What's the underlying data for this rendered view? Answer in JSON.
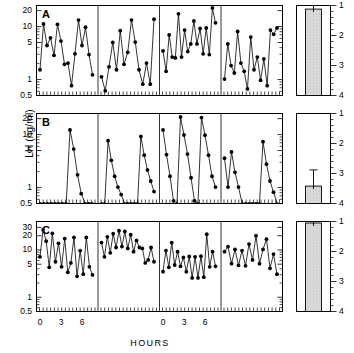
{
  "figure": {
    "axis_label_left": "LH (ng/ml)",
    "axis_label_right": "LH INTERPULSE INTERVAL  (hours)",
    "axis_label_x": "HOURS"
  },
  "chart_data": {
    "type": "line",
    "title": "",
    "xlabel": "HOURS",
    "ylabel": "LH (ng/ml)",
    "y_scale": "log",
    "x_scale": "linear",
    "xlim": [
      0,
      7.5
    ],
    "x_tick_labels": [
      "0",
      "3",
      "6"
    ],
    "x_tick_values": [
      0,
      3,
      6
    ],
    "grid": false,
    "legend": false,
    "panels": [
      {
        "id": "A",
        "label": "A",
        "ylim": [
          0.5,
          25
        ],
        "y_tick_labels": [
          "20",
          "10",
          "5",
          "1",
          "0.5"
        ],
        "y_tick_values": [
          20,
          10,
          5,
          1,
          0.5
        ],
        "subjects": [
          {
            "index": 1,
            "x": [
              0,
              0.5,
              1,
              1.5,
              2,
              2.5,
              3,
              3.5,
              4,
              4.5,
              5,
              5.5,
              6,
              6.5,
              7
            ],
            "y": [
              1.5,
              11,
              4.3,
              6.0,
              2.8,
              10.8,
              5.2,
              1.9,
              2.0,
              0.75,
              3.0,
              13.0,
              4.3,
              9.5,
              2.9,
              1.2
            ]
          },
          {
            "index": 2,
            "x": [
              0,
              0.5,
              1,
              1.5,
              2,
              2.5,
              3,
              3.5,
              4,
              4.5,
              5,
              5.5,
              6,
              6.5,
              7
            ],
            "y": [
              1.1,
              0.6,
              1.7,
              4.9,
              1.5,
              8.2,
              1.9,
              3.2,
              13.0,
              5.0,
              1.5,
              0.8,
              2.0,
              0.8,
              13.5
            ]
          },
          {
            "index": 3,
            "x": [
              0,
              0.5,
              1,
              1.5,
              2,
              2.5,
              3,
              3.5,
              4,
              4.5,
              5,
              5.5,
              6,
              6.5,
              7
            ],
            "y": [
              3.4,
              1.4,
              6.8,
              2.6,
              2.5,
              17.0,
              2.6,
              8.4,
              3.3,
              4.6,
              12.5,
              4.6,
              9.0,
              3.0,
              9.2,
              2.9,
              22.0,
              11.5
            ]
          },
          {
            "index": 4,
            "x": [
              0,
              0.5,
              1,
              1.5,
              2,
              2.5,
              3,
              3.5,
              4,
              4.5,
              5,
              5.5,
              6,
              6.5,
              7
            ],
            "y": [
              1.0,
              4.6,
              1.8,
              1.3,
              7.9,
              2.0,
              1.4,
              0.65,
              6.2,
              1.5,
              2.6,
              0.95,
              2.4,
              0.75,
              8.4,
              7.0,
              9.2
            ]
          }
        ],
        "bar": {
          "value": 1.12,
          "error_upper": 1.0,
          "error_lower": 1.22,
          "ylim": [
            1,
            4
          ],
          "y_tick_labels": [
            "1",
            "2",
            "3",
            "4"
          ],
          "y_tick_values": [
            1,
            2,
            3,
            4
          ],
          "units": "hours"
        }
      },
      {
        "id": "B",
        "label": "B",
        "ylim": [
          0.5,
          25
        ],
        "y_tick_labels": [
          "20",
          "10",
          "5",
          "1",
          "0.5"
        ],
        "y_tick_values": [
          20,
          10,
          5,
          1,
          0.5
        ],
        "subjects": [
          {
            "index": 1,
            "x": [
              0,
              0.5,
              1,
              1.5,
              2,
              2.5,
              3,
              3.5,
              4,
              4.5,
              5,
              5.5,
              6,
              6.5,
              7
            ],
            "y": [
              0.5,
              0.5,
              0.5,
              0.5,
              0.5,
              0.5,
              0.5,
              0.5,
              12.0,
              5.2,
              1.7,
              0.75,
              0.5,
              0.5,
              0.5
            ]
          },
          {
            "index": 2,
            "x": [
              0,
              0.5,
              1,
              1.5,
              2,
              2.5,
              3,
              3.5,
              4,
              4.5,
              5,
              5.5,
              6,
              6.5,
              7
            ],
            "y": [
              0.5,
              0.5,
              7.5,
              3.2,
              1.6,
              1.0,
              0.72,
              0.5,
              0.5,
              0.5,
              0.5,
              0.5,
              9.0,
              4.0,
              2.1,
              1.3,
              0.82
            ]
          },
          {
            "index": 3,
            "x": [
              0,
              0.5,
              1,
              1.5,
              2,
              2.5,
              3,
              3.5,
              4,
              4.5,
              5,
              5.5,
              6,
              6.5,
              7
            ],
            "y": [
              12.0,
              4.1,
              1.6,
              0.55,
              0.5,
              21.0,
              9.6,
              4.2,
              1.5,
              0.55,
              0.5,
              20.5,
              9.5,
              4.0,
              1.6,
              1.0
            ]
          },
          {
            "index": 4,
            "x": [
              0,
              0.5,
              1,
              1.5,
              2,
              2.5,
              3,
              3.5,
              4,
              4.5,
              5,
              5.5,
              6,
              6.5,
              7
            ],
            "y": [
              3.5,
              1.0,
              4.6,
              1.9,
              1.0,
              0.5,
              0.5,
              0.5,
              0.5,
              0.5,
              0.5,
              7.2,
              2.7,
              1.3,
              0.8,
              0.5
            ]
          }
        ],
        "bar": {
          "value": 3.42,
          "error_upper": 2.88,
          "error_lower": 3.95,
          "ylim": [
            1,
            4
          ],
          "y_tick_labels": [
            "1",
            "2",
            "3",
            "4"
          ],
          "y_tick_values": [
            1,
            2,
            3,
            4
          ],
          "units": "hours"
        }
      },
      {
        "id": "C",
        "label": "C",
        "ylim": [
          0.5,
          40
        ],
        "y_tick_labels": [
          "30",
          "20",
          "10",
          "5",
          "1",
          "0.5"
        ],
        "y_tick_values": [
          30,
          20,
          10,
          5,
          1,
          0.5
        ],
        "subjects": [
          {
            "index": 1,
            "x": [
              0,
              0.5,
              1,
              1.5,
              2,
              2.5,
              3,
              3.5,
              4,
              4.5,
              5,
              5.5,
              6,
              6.5,
              7
            ],
            "y": [
              7.0,
              26.0,
              15.0,
              4.2,
              22.0,
              5.5,
              13.5,
              4.3,
              17.0,
              3.3,
              5.2,
              18.0,
              2.7,
              9.5,
              3.0,
              18.0,
              4.3,
              2.9
            ]
          },
          {
            "index": 2,
            "x": [
              0,
              0.5,
              1,
              1.5,
              2,
              2.5,
              3,
              3.5,
              4,
              4.5,
              5,
              5.5,
              6,
              6.5,
              7
            ],
            "y": [
              14.0,
              7.0,
              18.5,
              8.5,
              21.5,
              11.0,
              25.0,
              11.5,
              24.0,
              10.5,
              20.5,
              9.0,
              15.5,
              11.0,
              10.5,
              5.2,
              6.0,
              11.0,
              5.5
            ]
          },
          {
            "index": 3,
            "x": [
              0,
              0.5,
              1,
              1.5,
              2,
              2.5,
              3,
              3.5,
              4,
              4.5,
              5,
              5.5,
              6,
              6.5,
              7
            ],
            "y": [
              3.4,
              9.5,
              4.2,
              14.0,
              4.7,
              9.0,
              4.4,
              6.8,
              3.4,
              7.1,
              2.5,
              7.0,
              2.5,
              7.2,
              2.6,
              21.0,
              4.3,
              9.0,
              4.4
            ]
          },
          {
            "index": 4,
            "x": [
              0,
              0.5,
              1,
              1.5,
              2,
              2.5,
              3,
              3.5,
              4,
              4.5,
              5,
              5.5,
              6,
              6.5,
              7
            ],
            "y": [
              9.0,
              11.5,
              5.0,
              10.0,
              4.6,
              9.5,
              4.5,
              13.0,
              6.0,
              19.5,
              5.0,
              10.0,
              16.5,
              4.0,
              8.0,
              3.0
            ]
          }
        ],
        "bar": {
          "value": 1.05,
          "error_upper": 0.9,
          "error_lower": 1.18,
          "ylim": [
            1,
            4
          ],
          "y_tick_labels": [
            "1",
            "2",
            "3",
            "4"
          ],
          "y_tick_values": [
            1,
            2,
            3,
            4
          ],
          "units": "hours"
        }
      }
    ]
  }
}
